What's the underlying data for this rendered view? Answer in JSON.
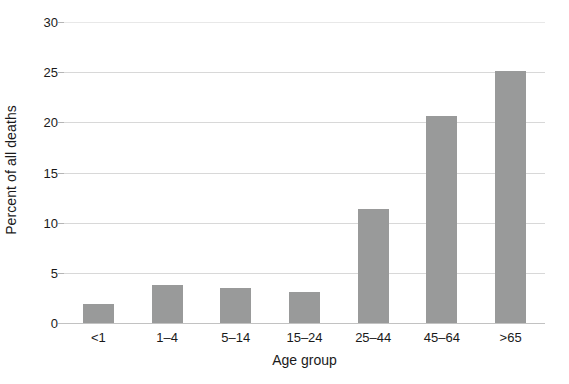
{
  "chart_data": {
    "type": "bar",
    "title": "",
    "xlabel": "Age group",
    "ylabel": "Percent of all deaths",
    "categories": [
      "<1",
      "1–4",
      "5–14",
      "15–24",
      "25–44",
      "45–64",
      ">65"
    ],
    "values": [
      1.9,
      3.8,
      3.5,
      3.1,
      11.4,
      20.6,
      25.1
    ],
    "ylim": [
      0,
      30
    ],
    "yticks": [
      0,
      5,
      10,
      15,
      20,
      25,
      30
    ],
    "ytick_labels": [
      "0",
      "5",
      "10",
      "15",
      "20",
      "25",
      "30"
    ],
    "grid": true,
    "grid_axis": "y",
    "legend": false,
    "legend_position": "none",
    "bar_color": "#999a9a",
    "grid_color": "#d8d8d8",
    "axis_color": "#c2c2c2",
    "text_color": "#1a1a1a",
    "background": "#ffffff"
  }
}
